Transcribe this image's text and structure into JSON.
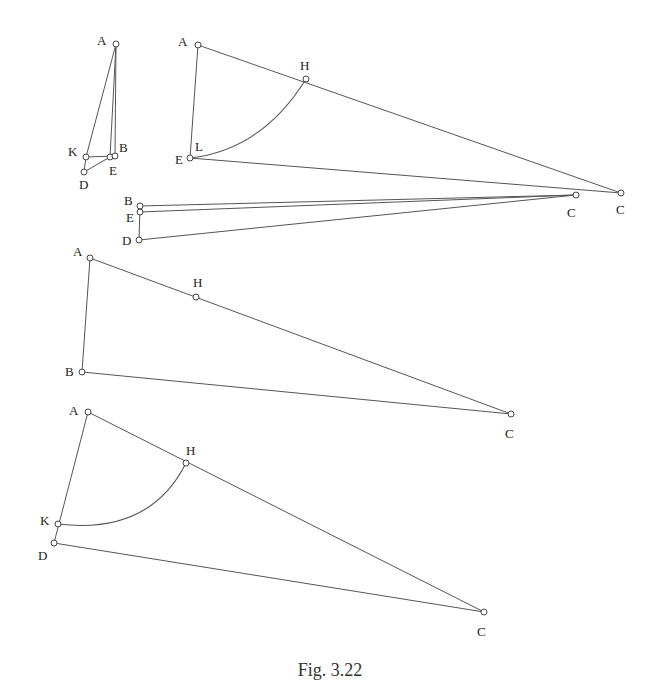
{
  "caption": "Fig. 3.22",
  "colors": {
    "stroke": "#555555",
    "text": "#222222",
    "background": "#ffffff"
  },
  "figures": [
    {
      "id": "fig-small",
      "points": [
        {
          "label": "A",
          "x": 116,
          "y": 44,
          "lx": 97,
          "ly": 45
        },
        {
          "label": "K",
          "x": 86,
          "y": 157,
          "lx": 68,
          "ly": 156
        },
        {
          "label": "E",
          "x": 110,
          "y": 157,
          "lx": 109,
          "ly": 175
        },
        {
          "label": "B",
          "x": 115,
          "y": 156,
          "lx": 119,
          "ly": 152
        },
        {
          "label": "D",
          "x": 84,
          "y": 172,
          "lx": 79,
          "ly": 189
        }
      ],
      "segments": [
        [
          "A",
          "K"
        ],
        [
          "A",
          "E"
        ],
        [
          "A",
          "B"
        ],
        [
          "K",
          "B"
        ],
        [
          "D",
          "E"
        ],
        [
          "K",
          "D"
        ]
      ]
    },
    {
      "id": "fig-top-right",
      "points": [
        {
          "label": "A",
          "x": 198,
          "y": 45,
          "lx": 178,
          "ly": 46
        },
        {
          "label": "H",
          "x": 306,
          "y": 79,
          "lx": 300,
          "ly": 70
        },
        {
          "label": "E",
          "x": 190,
          "y": 158,
          "lx": 175,
          "ly": 164
        },
        {
          "label": "C",
          "x": 621,
          "y": 193,
          "lx": 616,
          "ly": 214
        }
      ],
      "extra_labels": [
        {
          "label": "L",
          "x": 195,
          "y": 151
        }
      ],
      "segments": [
        [
          "A",
          "C"
        ],
        [
          "A",
          "E"
        ],
        [
          "E",
          "C"
        ]
      ],
      "arc": {
        "from": "E",
        "to": "H",
        "ctrl": [
          262,
          150
        ]
      }
    },
    {
      "id": "fig-thin",
      "points": [
        {
          "label": "B",
          "x": 140,
          "y": 206,
          "lx": 124,
          "ly": 205
        },
        {
          "label": "E",
          "x": 140,
          "y": 212,
          "lx": 126,
          "ly": 222
        },
        {
          "label": "D",
          "x": 139,
          "y": 240,
          "lx": 122,
          "ly": 245
        },
        {
          "label": "C",
          "x": 576,
          "y": 195,
          "lx": 567,
          "ly": 217
        }
      ],
      "segments": [
        [
          "B",
          "C"
        ],
        [
          "E",
          "C"
        ],
        [
          "D",
          "C"
        ],
        [
          "B",
          "D"
        ]
      ]
    },
    {
      "id": "fig-middle",
      "points": [
        {
          "label": "A",
          "x": 90,
          "y": 258,
          "lx": 73,
          "ly": 256
        },
        {
          "label": "H",
          "x": 196,
          "y": 297,
          "lx": 193,
          "ly": 287
        },
        {
          "label": "B",
          "x": 82,
          "y": 372,
          "lx": 65,
          "ly": 376
        },
        {
          "label": "C",
          "x": 511,
          "y": 414,
          "lx": 505,
          "ly": 438
        }
      ],
      "segments": [
        [
          "A",
          "C"
        ],
        [
          "A",
          "B"
        ],
        [
          "B",
          "C"
        ]
      ]
    },
    {
      "id": "fig-bottom",
      "points": [
        {
          "label": "A",
          "x": 88,
          "y": 412,
          "lx": 69,
          "ly": 415
        },
        {
          "label": "H",
          "x": 186,
          "y": 463,
          "lx": 186,
          "ly": 455
        },
        {
          "label": "K",
          "x": 58,
          "y": 524,
          "lx": 40,
          "ly": 525
        },
        {
          "label": "D",
          "x": 54,
          "y": 543,
          "lx": 38,
          "ly": 560
        },
        {
          "label": "C",
          "x": 484,
          "y": 612,
          "lx": 477,
          "ly": 636
        }
      ],
      "segments": [
        [
          "A",
          "C"
        ],
        [
          "A",
          "D"
        ],
        [
          "D",
          "C"
        ]
      ],
      "arc": {
        "from": "K",
        "to": "H",
        "ctrl": [
          150,
          535
        ]
      }
    }
  ]
}
